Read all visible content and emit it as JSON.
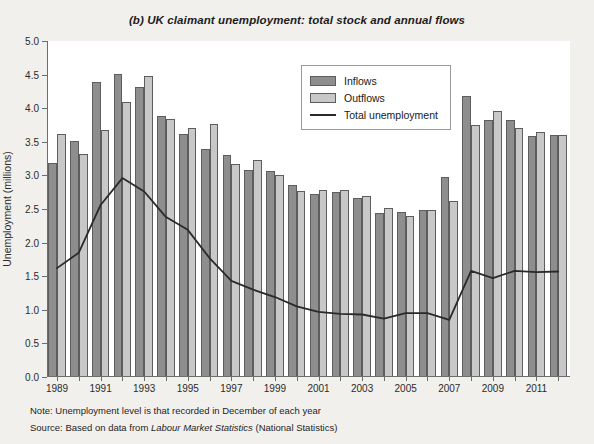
{
  "title": "(b) UK claimant unemployment: total stock and annual flows",
  "note": "Note: Unemployment level is that recorded in December of each year",
  "source_prefix": "Source: Based on data from ",
  "source_italic": "Labour Market Statistics",
  "source_suffix": " (National Statistics)",
  "legend": {
    "inflows": "Inflows",
    "outflows": "Outflows",
    "total": "Total unemployment"
  },
  "colors": {
    "inflow_fill": "#8e8e8e",
    "outflow_fill": "#c8c8c8",
    "line": "#2a2a2a",
    "plot_bg": "#ffffff",
    "page_bg": "#f2f0ec",
    "axis": "#6d6d6d"
  },
  "chart_data": {
    "type": "bar",
    "title": "(b) UK claimant unemployment: total stock and annual flows",
    "xlabel": "",
    "ylabel": "Unemployment (millions)",
    "ylim": [
      0.0,
      5.0
    ],
    "ytick_step": 0.5,
    "yticks": [
      "0.0",
      "0.5",
      "1.0",
      "1.5",
      "2.0",
      "2.5",
      "3.0",
      "3.5",
      "4.0",
      "4.5",
      "5.0"
    ],
    "grid": false,
    "legend_position": "top-center",
    "categories": [
      1989,
      1990,
      1991,
      1992,
      1993,
      1994,
      1995,
      1996,
      1997,
      1998,
      1999,
      2000,
      2001,
      2002,
      2003,
      2004,
      2005,
      2006,
      2007,
      2008,
      2009,
      2010,
      2011,
      2012
    ],
    "xtick_labels": [
      "1989",
      "",
      "1991",
      "",
      "1993",
      "",
      "1995",
      "",
      "1997",
      "",
      "1999",
      "",
      "2001",
      "",
      "2003",
      "",
      "2005",
      "",
      "2007",
      "",
      "2009",
      "",
      "2011",
      ""
    ],
    "series": [
      {
        "name": "Inflows",
        "kind": "bar",
        "color": "#8e8e8e",
        "values": [
          3.18,
          3.51,
          4.39,
          4.51,
          4.31,
          3.88,
          3.62,
          3.4,
          3.3,
          3.08,
          3.07,
          2.86,
          2.73,
          2.75,
          2.66,
          2.44,
          2.46,
          2.49,
          2.97,
          4.18,
          3.82,
          3.82,
          3.59,
          3.6
        ]
      },
      {
        "name": "Outflows",
        "kind": "bar",
        "color": "#c8c8c8",
        "values": [
          3.61,
          3.32,
          3.67,
          4.09,
          4.48,
          3.84,
          3.7,
          3.76,
          3.17,
          3.23,
          3.0,
          2.77,
          2.79,
          2.78,
          2.69,
          2.52,
          2.4,
          2.48,
          2.62,
          3.75,
          3.96,
          3.7,
          3.64,
          3.6
        ]
      },
      {
        "name": "Total unemployment",
        "kind": "line",
        "color": "#2a2a2a",
        "values": [
          1.62,
          1.85,
          2.56,
          2.96,
          2.76,
          2.38,
          2.19,
          1.77,
          1.43,
          1.3,
          1.19,
          1.05,
          0.97,
          0.94,
          0.93,
          0.87,
          0.95,
          0.95,
          0.85,
          1.58,
          1.47,
          1.58,
          1.56,
          1.57
        ]
      }
    ]
  }
}
